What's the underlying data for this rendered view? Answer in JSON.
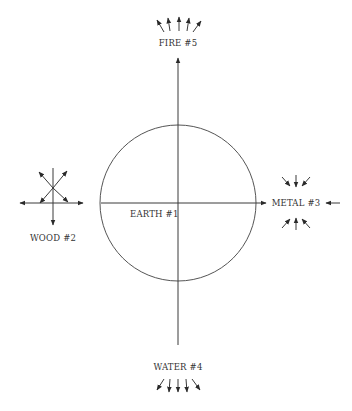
{
  "diagram": {
    "colors": {
      "line": "#3a3a3a",
      "text": "#333333",
      "background": "#ffffff"
    },
    "center": {
      "label": "EARTH #1",
      "movement": "centered / pivot"
    },
    "elements": [
      {
        "id": "earth",
        "label": "EARTH #1",
        "position": "center",
        "arrows": "none"
      },
      {
        "id": "wood",
        "label": "WOOD #2",
        "position": "left",
        "arrows": "expanding outward in all directions"
      },
      {
        "id": "metal",
        "label": "METAL #3",
        "position": "right",
        "arrows": "contracting inward"
      },
      {
        "id": "water",
        "label": "WATER #4",
        "position": "bottom",
        "arrows": "downward"
      },
      {
        "id": "fire",
        "label": "FIRE #5",
        "position": "top",
        "arrows": "upward"
      }
    ]
  }
}
